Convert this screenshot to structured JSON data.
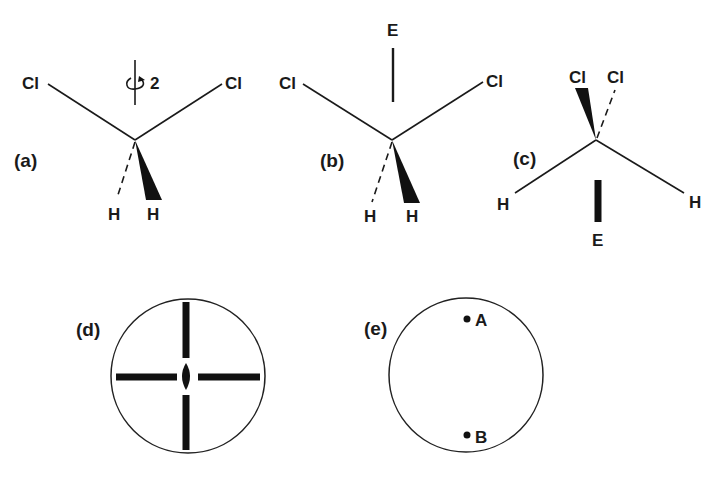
{
  "figure": {
    "panels": [
      {
        "id": "a",
        "label": "(a)",
        "description": "CH2Cl2 molecule with C2 rotation axis",
        "atoms": {
          "cl_left": "Cl",
          "cl_right": "Cl",
          "h_dashed": "H",
          "h_wedge": "H"
        },
        "axis_label": "2"
      },
      {
        "id": "b",
        "label": "(b)",
        "description": "CH2Cl2 molecule with E label above",
        "atoms": {
          "cl_left": "Cl",
          "cl_right": "Cl",
          "h_dashed": "H",
          "h_wedge": "H"
        },
        "axis_label": "E"
      },
      {
        "id": "c",
        "label": "(c)",
        "description": "CH2Cl2 molecule rotated, Cl atoms on top",
        "atoms": {
          "cl_wedge": "Cl",
          "cl_dashed": "Cl",
          "h_left": "H",
          "h_right": "H"
        },
        "axis_label": "E"
      },
      {
        "id": "d",
        "label": "(d)",
        "description": "Stereographic projection with C2 axis symbol and mirror planes"
      },
      {
        "id": "e",
        "label": "(e)",
        "description": "Stereographic projection with points A and B",
        "points": {
          "a": "A",
          "b": "B"
        }
      }
    ]
  }
}
